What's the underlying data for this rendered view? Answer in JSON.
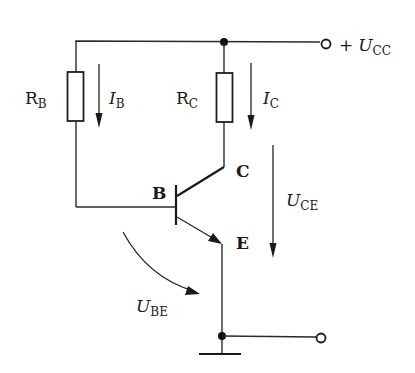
{
  "diagram": {
    "type": "common-emitter NPN transistor bias circuit",
    "colors": {
      "stroke": "#1a1a1a",
      "background": "#ffffff"
    },
    "components": {
      "base_resistor": {
        "label": "R",
        "sub": "B"
      },
      "collector_resistor": {
        "label": "R",
        "sub": "C"
      },
      "transistor": {
        "type": "NPN",
        "pins": {
          "base": "B",
          "collector": "C",
          "emitter": "E"
        }
      },
      "ground": {
        "symbol": "ground"
      }
    },
    "supply": {
      "plus": "+",
      "label": "U",
      "sub": "CC"
    },
    "currents": {
      "base_current": {
        "label": "I",
        "sub": "B",
        "direction": "down"
      },
      "collector_current": {
        "label": "I",
        "sub": "C",
        "direction": "down"
      }
    },
    "voltages": {
      "collector_emitter": {
        "label": "U",
        "sub": "CE",
        "direction": "down"
      },
      "base_emitter": {
        "label": "U",
        "sub": "BE",
        "direction": "curved"
      }
    },
    "terminals": [
      "+Ucc terminal",
      "ground output terminal"
    ]
  }
}
